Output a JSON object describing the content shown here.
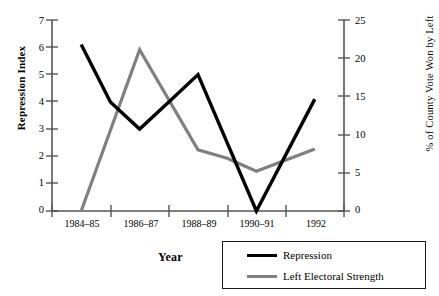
{
  "chart_data": {
    "type": "line",
    "title": "",
    "xlabel": "Year",
    "categories": [
      "1984–85",
      "1986–87",
      "1988–89",
      "1990–91",
      "1992"
    ],
    "grid": false,
    "legend_position": "bottom-right",
    "axes": {
      "left": {
        "label": "Repression Index",
        "ticks": [
          "7",
          "6",
          "5",
          "4",
          "3",
          "2",
          "1",
          "0"
        ],
        "values": [
          7,
          6,
          5,
          4,
          3,
          2,
          1,
          0
        ],
        "ylim": [
          0,
          7
        ]
      },
      "right": {
        "label": "% of County Vote Won by Left",
        "ticks": [
          "25",
          "20",
          "15",
          "10",
          "5",
          "0"
        ],
        "values": [
          25,
          20,
          15,
          10,
          5,
          0
        ],
        "ylim": [
          0,
          25
        ]
      }
    },
    "series": [
      {
        "name": "Repression",
        "axis": "left",
        "color": "#000000",
        "values": [
          6.1,
          3.0,
          5.0,
          0.0,
          4.1
        ],
        "vertices": [
          {
            "x": "1984–85",
            "y": 6.1
          },
          {
            "x": "1985–86",
            "y": 4.0
          },
          {
            "x": "1986–87",
            "y": 3.0
          },
          {
            "x": "1987–88",
            "y": 4.0
          },
          {
            "x": "1988–89",
            "y": 5.0
          },
          {
            "x": "1990–91",
            "y": 0.0
          },
          {
            "x": "1992",
            "y": 4.1
          }
        ]
      },
      {
        "name": "Left Electoral Strength",
        "axis": "right",
        "color": "#808080",
        "values": [
          0.0,
          21.1,
          8.0,
          5.2,
          8.1
        ],
        "vertices": [
          {
            "x": "1984–85",
            "y": 0.0
          },
          {
            "x": "1986–87",
            "y": 21.1
          },
          {
            "x": "1988–89",
            "y": 8.0
          },
          {
            "x": "1989–90",
            "y": 6.9
          },
          {
            "x": "1990–91",
            "y": 5.2
          },
          {
            "x": "1992",
            "y": 8.1
          }
        ]
      }
    ]
  },
  "legend": {
    "entries": [
      {
        "label": "Repression",
        "color": "#000000"
      },
      {
        "label": "Left Electoral Strength",
        "color": "#808080"
      }
    ]
  }
}
